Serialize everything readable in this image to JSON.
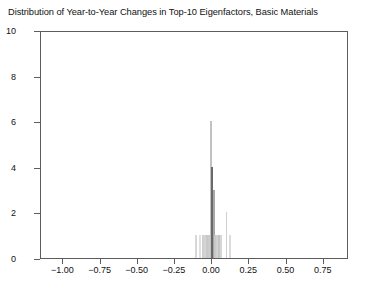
{
  "chart_data": {
    "type": "bar",
    "title": "Distribution of Year-to-Year Changes in Top-10 Eigenfactors, Basic Materials",
    "xlabel": "",
    "ylabel": "",
    "xlim": [
      -1.15,
      0.92
    ],
    "ylim": [
      0,
      10
    ],
    "grid": false,
    "legend": null,
    "xticks": [
      "-1.00",
      "-0.75",
      "-0.50",
      "-0.25",
      "0.00",
      "0.25",
      "0.50",
      "0.75"
    ],
    "xtick_values": [
      -1.0,
      -0.75,
      -0.5,
      -0.25,
      0.0,
      0.25,
      0.5,
      0.75
    ],
    "yticks": [
      "0",
      "2",
      "4",
      "6",
      "8",
      "10"
    ],
    "ytick_values": [
      0,
      2,
      4,
      6,
      8,
      10
    ],
    "bin_width": 0.012,
    "bars": [
      {
        "x": -0.108,
        "value": 1,
        "color": "#d8d8d8"
      },
      {
        "x": -0.084,
        "value": 1,
        "color": "#e0e0e0"
      },
      {
        "x": -0.06,
        "value": 1,
        "color": "#cfcfcf"
      },
      {
        "x": -0.046,
        "value": 1,
        "color": "#d4d4d4"
      },
      {
        "x": -0.034,
        "value": 1,
        "color": "#c8c8c8"
      },
      {
        "x": -0.022,
        "value": 1,
        "color": "#cccccc"
      },
      {
        "x": -0.01,
        "value": 6,
        "color": "#c2c2c2"
      },
      {
        "x": 0.0,
        "value": 4,
        "color": "#6a6a6a"
      },
      {
        "x": 0.011,
        "value": 3,
        "color": "#a8a8a8"
      },
      {
        "x": 0.022,
        "value": 1,
        "color": "#c9c9c9"
      },
      {
        "x": 0.034,
        "value": 1,
        "color": "#d2d2d2"
      },
      {
        "x": 0.046,
        "value": 1,
        "color": "#c5c5c5"
      },
      {
        "x": 0.058,
        "value": 1,
        "color": "#d6d6d6"
      },
      {
        "x": 0.096,
        "value": 2,
        "color": "#d0d0d0"
      },
      {
        "x": 0.12,
        "value": 1,
        "color": "#dcdcdc"
      }
    ],
    "colors": {
      "axis": "#5c5c5c",
      "text": "#111111",
      "bar_light": "#cfcfcf",
      "bar_dark": "#6a6a6a",
      "background": "#ffffff"
    }
  }
}
